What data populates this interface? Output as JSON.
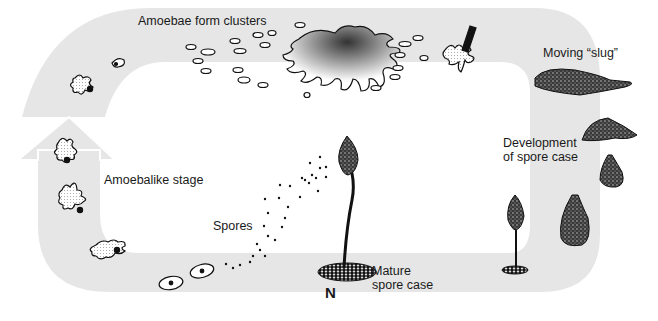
{
  "diagram": {
    "colors": {
      "band": "#e6e6e6",
      "background": "#ffffff",
      "ink": "#1a1a1a"
    },
    "labels": {
      "clusters": "Amoebae form clusters",
      "slug": "Moving “slug”",
      "development_line1": "Development",
      "development_line2": "of spore case",
      "amoebalike": "Amoebalike stage",
      "spores": "Spores",
      "mature_line1": "Mature",
      "mature_line2": "spore case",
      "n_marker": "N"
    },
    "stages": [
      "Amoebalike stage",
      "Amoebae form clusters",
      "Moving slug",
      "Development of spore case",
      "Mature spore case",
      "Spores"
    ]
  }
}
